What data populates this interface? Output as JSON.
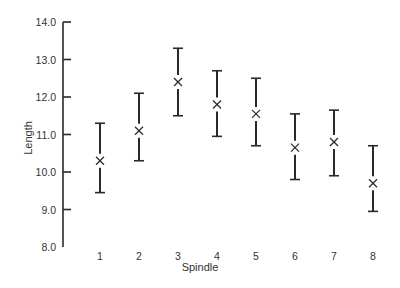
{
  "chart_data": {
    "type": "errorbar",
    "title": "",
    "xlabel": "Spindle",
    "ylabel": "Length",
    "categories": [
      "1",
      "2",
      "3",
      "4",
      "5",
      "6",
      "7",
      "8"
    ],
    "y_ticks": [
      "14.0",
      "13.0",
      "12.0",
      "11.0",
      "10.0",
      "9.0",
      "8.0"
    ],
    "ylim": [
      8.0,
      14.0
    ],
    "grid": false,
    "legend": null,
    "marker": "x",
    "series": [
      {
        "name": "Length",
        "means": [
          10.3,
          11.1,
          12.4,
          11.8,
          11.55,
          10.65,
          10.8,
          9.7
        ],
        "upper": [
          11.3,
          12.1,
          13.3,
          12.7,
          12.5,
          11.55,
          11.65,
          10.7
        ],
        "lower": [
          9.45,
          10.3,
          11.5,
          10.95,
          10.7,
          9.8,
          9.9,
          8.95
        ]
      }
    ]
  },
  "axis": {
    "x_title": "Spindle",
    "y_title": "Length"
  }
}
